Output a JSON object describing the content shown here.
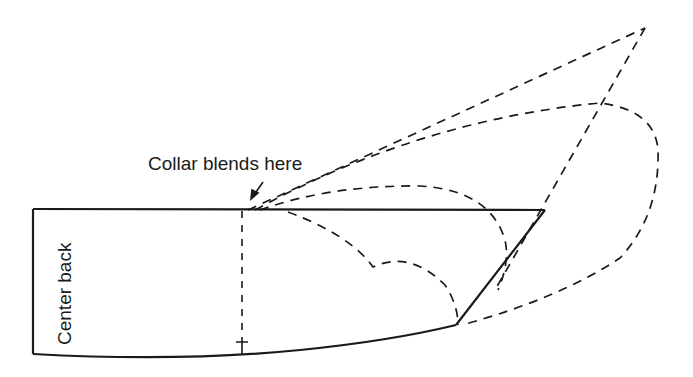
{
  "diagram": {
    "type": "collar pattern draft",
    "labels": {
      "collar_blend": "Collar blends here",
      "center_back": "Center back"
    },
    "colors": {
      "line": "#1a1a1a",
      "background": "#ffffff"
    },
    "elements": {
      "solid_outline": "collar pattern outline (center back, neckline, top edge, point)",
      "dashed_center_line": "vertical dashed guide with end tick",
      "dashed_curves": "alternate collar style outlines (scalloped, rounded, pointed)"
    }
  }
}
